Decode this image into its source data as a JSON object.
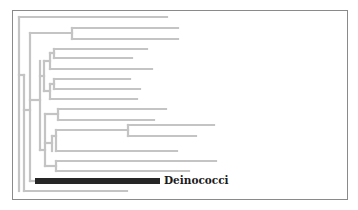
{
  "diagram": {
    "type": "phylogenetic-tree",
    "colors": {
      "branch": "#c4c4c4",
      "highlight": "#262626",
      "frame": "#8a8a8a",
      "label": "#1a1a1a"
    },
    "highlighted_clade": {
      "label": "Deinococci"
    },
    "leaf_count": 19
  }
}
